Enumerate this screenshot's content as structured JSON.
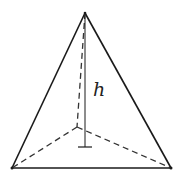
{
  "diagram": {
    "label_height": "h",
    "colors": {
      "stroke": "#1a1a1a",
      "dashed": "#333333",
      "background": "#ffffff"
    },
    "points": {
      "apex": [
        85,
        13
      ],
      "base_left": [
        12,
        168
      ],
      "base_right": [
        171,
        168
      ],
      "base_back": [
        77,
        127
      ],
      "height_foot": [
        85,
        147
      ]
    }
  }
}
